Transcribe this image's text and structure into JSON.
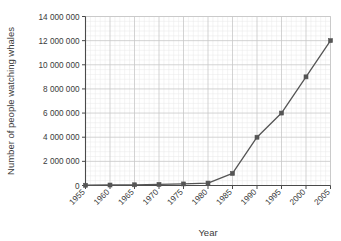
{
  "chart_data": {
    "type": "line",
    "title": "",
    "xlabel": "Year",
    "ylabel": "Number of people watching whales",
    "x": [
      1955,
      1960,
      1965,
      1970,
      1975,
      1980,
      1985,
      1990,
      1995,
      2000,
      2005
    ],
    "values": [
      20000,
      40000,
      60000,
      90000,
      130000,
      200000,
      1000000,
      4000000,
      6000000,
      9000000,
      12000000
    ],
    "xtick_labels": [
      "1955",
      "1960",
      "1965",
      "1970",
      "1975",
      "1980",
      "1985",
      "1990",
      "1995",
      "2000",
      "2005"
    ],
    "ytick_labels": [
      "0",
      "2 000 000",
      "4 000 000",
      "6 000 000",
      "8 000 000",
      "10 000 000",
      "12 000 000",
      "14 000 000"
    ],
    "ytick_values": [
      0,
      2000000,
      4000000,
      6000000,
      8000000,
      10000000,
      12000000,
      14000000
    ],
    "xlim": [
      1955,
      2005
    ],
    "ylim": [
      0,
      14000000
    ],
    "grid": true,
    "minor_grid": true,
    "minor_divisions": 5,
    "legend": "none",
    "marker": "square",
    "series_color": "#555555",
    "grid_color": "#c8c8c8",
    "minor_grid_color": "#e8e8e8",
    "axis_color": "#4a4a4a",
    "xtick_label_rotation": -45
  }
}
